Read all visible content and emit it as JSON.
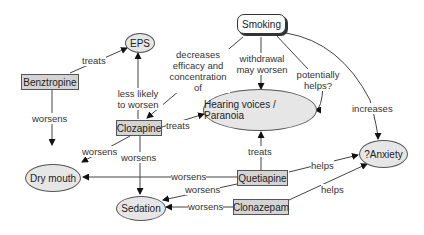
{
  "nodes": {
    "smoking": "Smoking",
    "eps": "EPS",
    "benztropine": "Benztropine",
    "clozapine": "Clozapine",
    "hearing_voices": "Hearing voices / Paranoia",
    "anxiety": "?Anxiety",
    "dry_mouth": "Dry mouth",
    "quetiapine": "Quetiapine",
    "sedation": "Sedation",
    "clonazepam": "Clonazepam"
  },
  "edges": [
    {
      "from": "Benztropine",
      "to": "EPS",
      "label": "treats"
    },
    {
      "from": "Benztropine",
      "to": "Dry mouth",
      "label": "worsens"
    },
    {
      "from": "Clozapine",
      "to": "EPS",
      "label": "less likely to worsen"
    },
    {
      "from": "Smoking",
      "to": "Clozapine",
      "label": "decreases efficacy and concentration of"
    },
    {
      "from": "Smoking",
      "to": "Hearing voices / Paranoia",
      "label": "withdrawal may worsen"
    },
    {
      "from": "Smoking",
      "to": "Hearing voices / Paranoia",
      "label": "potentially helps?"
    },
    {
      "from": "Smoking",
      "to": "?Anxiety",
      "label": "increases"
    },
    {
      "from": "Clozapine",
      "to": "Hearing voices / Paranoia",
      "label": "treats"
    },
    {
      "from": "Clozapine",
      "to": "Dry mouth",
      "label": "worsens"
    },
    {
      "from": "Clozapine",
      "to": "Sedation",
      "label": "worsens"
    },
    {
      "from": "Quetiapine",
      "to": "Hearing voices / Paranoia",
      "label": "treats"
    },
    {
      "from": "Quetiapine",
      "to": "Dry mouth",
      "label": "worsens"
    },
    {
      "from": "Quetiapine",
      "to": "Sedation",
      "label": "worsens"
    },
    {
      "from": "Quetiapine",
      "to": "?Anxiety",
      "label": "helps"
    },
    {
      "from": "Clonazepam",
      "to": "Sedation",
      "label": "worsens"
    },
    {
      "from": "Clonazepam",
      "to": "?Anxiety",
      "label": "helps"
    }
  ],
  "labels": {
    "benz_eps": "treats",
    "benz_dry": "worsens",
    "cloz_eps": "less likely to worsen",
    "smk_cloz": "decreases efficacy and concentration of",
    "smk_hv": "withdrawal may worsen",
    "smk_hv2": "potentially helps?",
    "smk_anx": "increases",
    "cloz_hv": "treats",
    "cloz_dry": "worsens",
    "cloz_sed": "worsens",
    "quet_hv": "treats",
    "quet_dry": "worsens",
    "quet_sed": "worsens",
    "quet_anx": "helps",
    "clon_sed": "worsens",
    "clon_anx": "helps"
  },
  "colors": {
    "drug_fill": "#d4d4d4",
    "condition_fill": "#e6e6e6",
    "line": "#333333"
  }
}
